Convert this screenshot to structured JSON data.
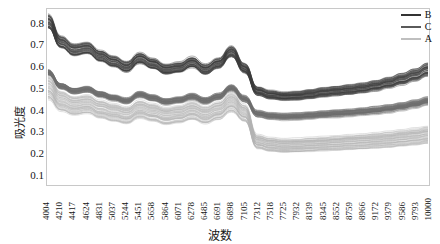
{
  "chart_data": {
    "type": "line",
    "title": "",
    "xlabel": "波数",
    "ylabel": "吸光度",
    "ylim": [
      0.05,
      0.87
    ],
    "yticks": [
      "0.8",
      "0.7",
      "0.6",
      "0.5",
      "0.4",
      "0.3",
      "0.2",
      "0.1"
    ],
    "ytick_values": [
      0.8,
      0.7,
      0.6,
      0.5,
      0.4,
      0.3,
      0.2,
      0.1
    ],
    "grid": false,
    "legend_position": "top-right",
    "xticks": [
      "4004",
      "4210",
      "4417",
      "4624",
      "4831",
      "5037",
      "5244",
      "5451",
      "5658",
      "5864",
      "6071",
      "6278",
      "6485",
      "6691",
      "6898",
      "7105",
      "7312",
      "7518",
      "7725",
      "7932",
      "8139",
      "8345",
      "8552",
      "8759",
      "8966",
      "9172",
      "9379",
      "9586",
      "9793",
      "10000"
    ],
    "x": [
      4004,
      4210,
      4417,
      4624,
      4831,
      5037,
      5244,
      5451,
      5658,
      5864,
      6071,
      6278,
      6485,
      6691,
      6898,
      7105,
      7312,
      7518,
      7725,
      7932,
      8139,
      8345,
      8552,
      8759,
      8966,
      9172,
      9379,
      9586,
      9793,
      10000
    ],
    "series": [
      {
        "name": "B",
        "color": "#3b3b3b",
        "values": [
          0.845,
          0.742,
          0.706,
          0.714,
          0.676,
          0.65,
          0.624,
          0.665,
          0.639,
          0.612,
          0.621,
          0.646,
          0.611,
          0.64,
          0.697,
          0.616,
          0.506,
          0.489,
          0.482,
          0.485,
          0.493,
          0.502,
          0.509,
          0.516,
          0.524,
          0.536,
          0.551,
          0.569,
          0.59,
          0.618
        ],
        "band_low": [
          0.78,
          0.688,
          0.652,
          0.662,
          0.626,
          0.6,
          0.576,
          0.616,
          0.592,
          0.566,
          0.574,
          0.598,
          0.566,
          0.594,
          0.648,
          0.572,
          0.468,
          0.452,
          0.446,
          0.448,
          0.454,
          0.462,
          0.468,
          0.474,
          0.481,
          0.491,
          0.504,
          0.519,
          0.537,
          0.559
        ]
      },
      {
        "name": "C",
        "color": "#6e6e6e",
        "values": [
          0.585,
          0.52,
          0.498,
          0.506,
          0.482,
          0.466,
          0.452,
          0.482,
          0.466,
          0.448,
          0.456,
          0.472,
          0.452,
          0.472,
          0.512,
          0.462,
          0.392,
          0.382,
          0.378,
          0.38,
          0.384,
          0.389,
          0.393,
          0.397,
          0.402,
          0.408,
          0.416,
          0.426,
          0.438,
          0.452
        ]
      },
      {
        "name": "A",
        "color": "#b3b3b3",
        "values": [
          0.56,
          0.486,
          0.462,
          0.47,
          0.444,
          0.428,
          0.414,
          0.444,
          0.428,
          0.41,
          0.418,
          0.436,
          0.414,
          0.436,
          0.478,
          0.424,
          0.282,
          0.268,
          0.262,
          0.264,
          0.268,
          0.272,
          0.276,
          0.28,
          0.284,
          0.289,
          0.295,
          0.302,
          0.31,
          0.32
        ],
        "band_low": [
          0.448,
          0.392,
          0.374,
          0.382,
          0.36,
          0.346,
          0.334,
          0.36,
          0.346,
          0.33,
          0.338,
          0.354,
          0.334,
          0.354,
          0.39,
          0.344,
          0.218,
          0.206,
          0.201,
          0.203,
          0.206,
          0.209,
          0.212,
          0.215,
          0.218,
          0.222,
          0.226,
          0.231,
          0.237,
          0.244
        ]
      }
    ]
  },
  "legend": {
    "items": [
      {
        "label": "B",
        "color": "#333333"
      },
      {
        "label": "C",
        "color": "#5a5a5a"
      },
      {
        "label": "A",
        "color": "#bfbfbf"
      }
    ]
  }
}
